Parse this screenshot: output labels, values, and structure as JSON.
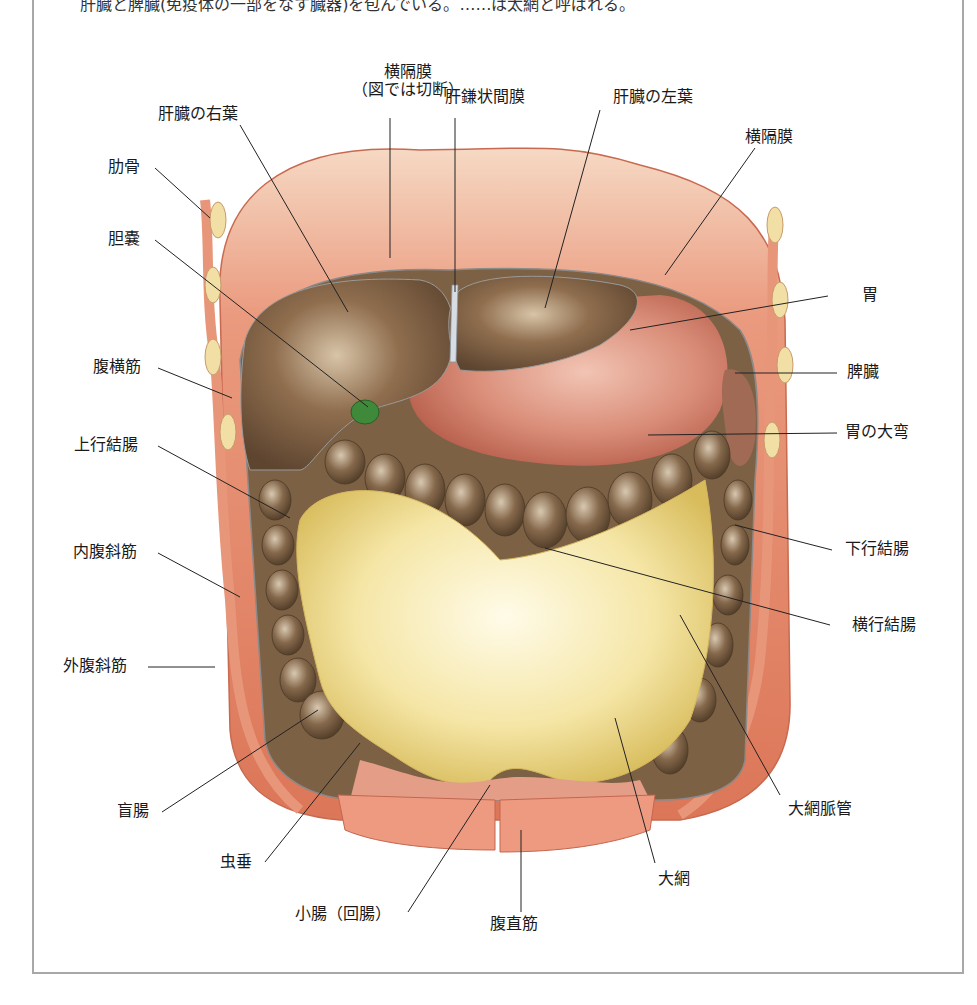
{
  "caption": "肝臓と脾臓(免疫体の一部をなす臓器)を包んでいる。……は太網と呼ばれる。",
  "figure": {
    "colors": {
      "muscle": "#e58a6c",
      "muscle_dark": "#cf5c3f",
      "liver": "#8a6a4a",
      "stomach": "#d99080",
      "omentum": "#f3e3a0",
      "colon": "#7a6248",
      "gallbladder": "#3f8a3a",
      "frame_border": "#a8a8a8",
      "leader_line": "#222222"
    },
    "labels": [
      {
        "id": "diaphragm-cut",
        "text_line1": "横隔膜",
        "text_line2": "（図では切断）"
      },
      {
        "id": "liver-right-lobe",
        "text": "肝臓の右葉"
      },
      {
        "id": "falciform-ligament",
        "text": "肝鎌状間膜"
      },
      {
        "id": "liver-left-lobe",
        "text": "肝臓の左葉"
      },
      {
        "id": "diaphragm",
        "text": "横隔膜"
      },
      {
        "id": "rib",
        "text": "肋骨"
      },
      {
        "id": "gallbladder",
        "text": "胆嚢"
      },
      {
        "id": "stomach",
        "text": "胃"
      },
      {
        "id": "transversus-abdominis",
        "text": "腹横筋"
      },
      {
        "id": "spleen",
        "text": "脾臓"
      },
      {
        "id": "greater-curvature",
        "text": "胃の大弯"
      },
      {
        "id": "ascending-colon",
        "text": "上行結腸"
      },
      {
        "id": "descending-colon",
        "text": "下行結腸"
      },
      {
        "id": "internal-oblique",
        "text": "内腹斜筋"
      },
      {
        "id": "transverse-colon",
        "text": "横行結腸"
      },
      {
        "id": "external-oblique",
        "text": "外腹斜筋"
      },
      {
        "id": "cecum",
        "text": "盲腸"
      },
      {
        "id": "omental-vessels",
        "text": "大網脈管"
      },
      {
        "id": "appendix",
        "text": "虫垂"
      },
      {
        "id": "greater-omentum",
        "text": "大網"
      },
      {
        "id": "small-intestine",
        "text": "小腸（回腸）"
      },
      {
        "id": "rectus-abdominis",
        "text": "腹直筋"
      }
    ]
  }
}
